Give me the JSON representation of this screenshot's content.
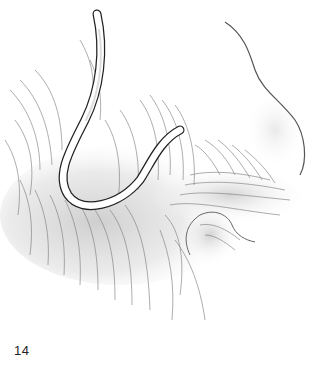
{
  "figure": {
    "number": "14",
    "colors": {
      "line": "#555555",
      "shade": "#d6d6d6",
      "tube_fill": "#ffffff",
      "tube_outline": "#222222"
    }
  }
}
